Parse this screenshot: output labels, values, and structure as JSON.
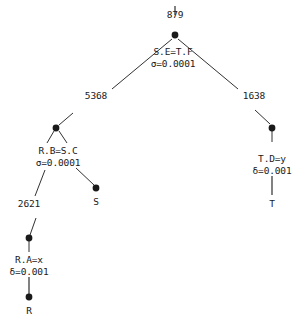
{
  "diagram": {
    "type": "query-execution-plan-tree",
    "background_color": "#ffffff",
    "ink_color": "#1a1a1a",
    "root_stub_label": "",
    "nodes": [
      {
        "id": "root",
        "operator": "S.E=T.F",
        "parameter": "σ=0.0001",
        "output_cardinality": "879",
        "x": 175,
        "y": 35,
        "kind": "join"
      },
      {
        "id": "join-rs",
        "operator": "R.B=S.C",
        "parameter": "σ=0.0001",
        "output_cardinality": "5368",
        "x": 56,
        "y": 128,
        "kind": "join"
      },
      {
        "id": "select-t",
        "operator": "T.D=y",
        "parameter": "δ=0.001",
        "output_cardinality": "1638",
        "x": 272,
        "y": 128,
        "kind": "select"
      },
      {
        "id": "select-r",
        "operator": "R.A=x",
        "parameter": "δ=0.001",
        "output_cardinality": "2621",
        "x": 29,
        "y": 238,
        "kind": "select"
      },
      {
        "id": "leaf-s",
        "operator": "S",
        "parameter": "",
        "output_cardinality": "",
        "x": 96,
        "y": 188,
        "kind": "relation"
      },
      {
        "id": "leaf-r",
        "operator": "R",
        "parameter": "",
        "output_cardinality": "",
        "x": 29,
        "y": 297,
        "kind": "relation"
      },
      {
        "id": "leaf-t",
        "operator": "T",
        "parameter": "",
        "output_cardinality": "",
        "x": 272,
        "y": 196,
        "kind": "relation"
      }
    ],
    "labels": {
      "root_cardinality": "879",
      "root_operator": "S.E=T.F",
      "root_parameter": "σ=0.0001",
      "left_edge_cardinality": "5368",
      "right_edge_cardinality": "1638",
      "join_rs_operator": "R.B=S.C",
      "join_rs_parameter": "σ=0.0001",
      "select_t_operator": "T.D=y",
      "select_t_parameter": "δ=0.001",
      "select_r_edge_cardinality": "2621",
      "select_r_operator": "R.A=x",
      "select_r_parameter": "δ=0.001",
      "relation_s": "S",
      "relation_r": "R",
      "relation_t": "T"
    }
  }
}
